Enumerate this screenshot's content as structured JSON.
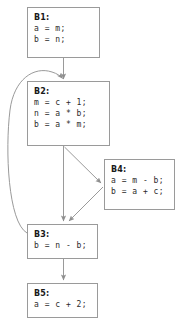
{
  "diagram": {
    "line_color": "#9a9a9a",
    "text_color": "#2b2b2b",
    "label_color": "#1a1a1a",
    "background": "#ffffff"
  },
  "blocks": [
    {
      "id": "B1",
      "label": "B1:",
      "statements": [
        "a = m;",
        "b = n;"
      ],
      "x": 27,
      "y": 7,
      "w": 73,
      "h": 51
    },
    {
      "id": "B2",
      "label": "B2:",
      "statements": [
        "m = c + 1;",
        "n = a * b;",
        "b = a * m;"
      ],
      "x": 27,
      "y": 81,
      "w": 83,
      "h": 65
    },
    {
      "id": "B4",
      "label": "B4:",
      "statements": [
        "a = m - b;",
        "b = a + c;"
      ],
      "x": 104,
      "y": 159,
      "w": 71,
      "h": 51
    },
    {
      "id": "B3",
      "label": "B3:",
      "statements": [
        "b = n - b;"
      ],
      "x": 27,
      "y": 224,
      "w": 71,
      "h": 35
    },
    {
      "id": "B5",
      "label": "B5:",
      "statements": [
        "a = c + 2;"
      ],
      "x": 27,
      "y": 283,
      "w": 71,
      "h": 35
    }
  ],
  "edges": [
    {
      "id": "e1",
      "from": "B1",
      "to": "B2",
      "kind": "straight"
    },
    {
      "id": "e2",
      "from": "B2",
      "to": "B3",
      "kind": "straight"
    },
    {
      "id": "e3",
      "from": "B2",
      "to": "B4",
      "kind": "diagonal"
    },
    {
      "id": "e4",
      "from": "B4",
      "to": "B3",
      "kind": "diagonal"
    },
    {
      "id": "e5",
      "from": "B3",
      "to": "B5",
      "kind": "straight"
    },
    {
      "id": "e6",
      "from": "B3",
      "to": "B2",
      "kind": "back-edge-curve"
    }
  ]
}
